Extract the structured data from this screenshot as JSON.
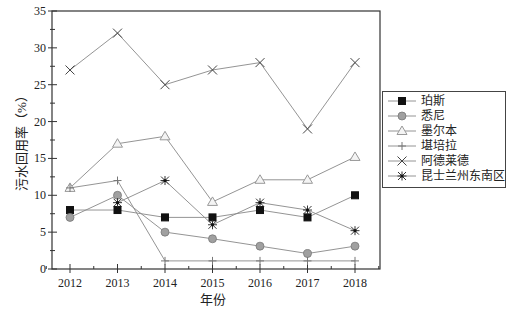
{
  "chart_data": {
    "type": "line",
    "title": "",
    "xlabel": "年份",
    "ylabel": "污水回用率（%）",
    "x": [
      2012,
      2013,
      2014,
      2015,
      2016,
      2017,
      2018
    ],
    "xticks": [
      "2012",
      "2013",
      "2014",
      "2015",
      "2016",
      "2017",
      "2018"
    ],
    "ylim": [
      0,
      35
    ],
    "yticks": [
      "0",
      "5",
      "10",
      "15",
      "20",
      "25",
      "30",
      "35"
    ],
    "grid": false,
    "legend_position": "right",
    "series": [
      {
        "name": "珀斯",
        "marker": "filled-square",
        "color": "#000000",
        "values": [
          8,
          8,
          7,
          7,
          8,
          7,
          10
        ]
      },
      {
        "name": "悉尼",
        "marker": "gray-circle",
        "color": "#999999",
        "values": [
          7,
          10,
          5,
          4.1,
          3.1,
          2.1,
          3.1
        ]
      },
      {
        "name": "墨尔本",
        "marker": "open-triangle",
        "color": "#bbbbbb",
        "values": [
          11,
          17,
          18,
          9.1,
          12.1,
          12.1,
          15.2
        ]
      },
      {
        "name": "堪培拉",
        "marker": "plus",
        "color": "#777777",
        "values": [
          11,
          12,
          1.1,
          1.1,
          1.1,
          1.1,
          1.1
        ]
      },
      {
        "name": "阿德莱德",
        "marker": "x",
        "color": "#555555",
        "values": [
          27,
          32,
          25,
          27,
          28,
          19,
          28
        ]
      },
      {
        "name": "昆士兰州东南区",
        "marker": "asterisk",
        "color": "#333333",
        "values": [
          null,
          9,
          12,
          6,
          9,
          8,
          5.2
        ]
      }
    ]
  },
  "legend": {
    "items": [
      {
        "label": "珀斯",
        "icon": "filled-square-icon"
      },
      {
        "label": "悉尼",
        "icon": "gray-circle-icon"
      },
      {
        "label": "墨尔本",
        "icon": "open-triangle-icon"
      },
      {
        "label": "堪培拉",
        "icon": "plus-icon"
      },
      {
        "label": "阿德莱德",
        "icon": "x-mark-icon"
      },
      {
        "label": "昆士兰州东南区",
        "icon": "asterisk-icon"
      }
    ]
  },
  "axes": {
    "xlabel": "年份",
    "ylabel": "污水回用率（%）"
  }
}
